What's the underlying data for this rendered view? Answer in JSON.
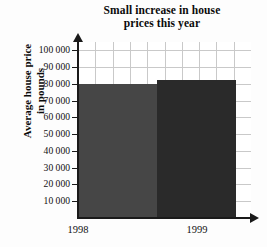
{
  "title": {
    "line1": "Small increase in house",
    "line2": "prices this year"
  },
  "axes": {
    "y_title_line1": "Average house price",
    "y_title_line2": "in pounds"
  },
  "chart_data": {
    "type": "bar",
    "title": "Small increase in house prices this year",
    "xlabel": "",
    "ylabel": "Average house price in pounds",
    "categories": [
      "1998",
      "1999"
    ],
    "values": [
      80000,
      82500
    ],
    "value_labels": [
      "80 000",
      "82 500"
    ],
    "ylim": [
      0,
      105000
    ],
    "ytick_values": [
      10000,
      20000,
      30000,
      40000,
      50000,
      60000,
      70000,
      80000,
      90000,
      100000
    ],
    "ytick_labels": [
      "10 000",
      "20 000",
      "30 000",
      "40 000",
      "50 000",
      "60 000",
      "70 000",
      "80 000",
      "90 000",
      "100 000"
    ],
    "grid": true,
    "legend": false,
    "bar_colors": [
      "#464646",
      "#2a2a2a"
    ],
    "grid_color": "#c9c9c9",
    "axis_color": "#1a1a1a",
    "background": "#ffffff",
    "note": "Truncated/identical-looking bars; y-axis does not reach top of plot area"
  }
}
